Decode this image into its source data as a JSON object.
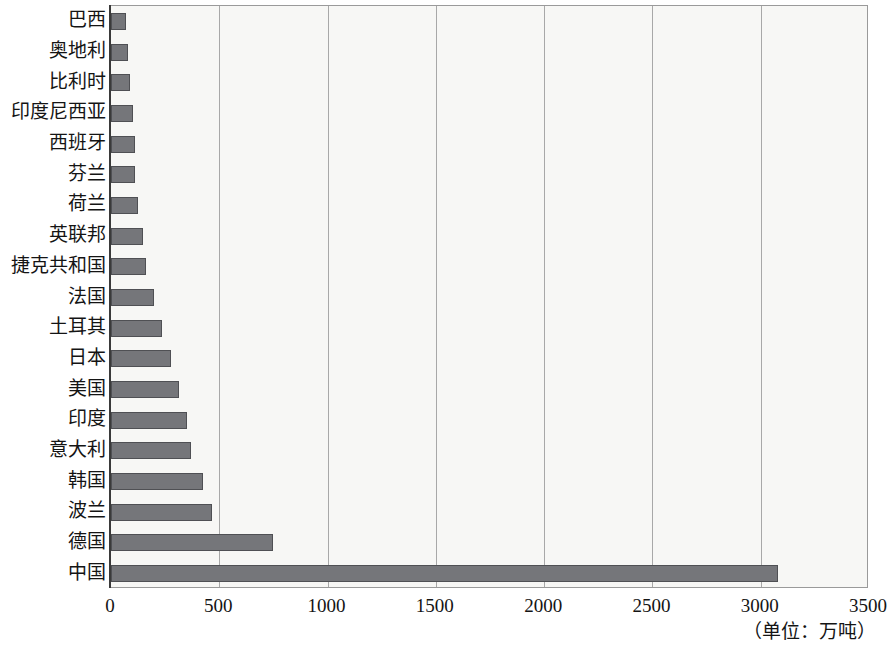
{
  "chart_data": {
    "type": "bar",
    "orientation": "horizontal",
    "title": "",
    "subtitle": "",
    "xlabel": "",
    "ylabel": "",
    "unit_note": "（单位：万吨）",
    "xlim": [
      0,
      3500
    ],
    "xticks": [
      "0",
      "500",
      "1000",
      "1500",
      "2000",
      "2500",
      "3000",
      "3500"
    ],
    "xtick_values": [
      0,
      500,
      1000,
      1500,
      2000,
      2500,
      3000,
      3500
    ],
    "grid": "vertical",
    "legend": "none",
    "bar_color": "#75767a",
    "bar_edge_color": "#4f5054",
    "plot_background": "#f7f7f5",
    "categories": [
      "巴西",
      "奥地利",
      "比利时",
      "印度尼西亚",
      "西班牙",
      "芬兰",
      "荷兰",
      "英联邦",
      "捷克共和国",
      "法国",
      "土耳其",
      "日本",
      "美国",
      "印度",
      "意大利",
      "韩国",
      "波兰",
      "德国",
      "中国"
    ],
    "values": [
      70,
      80,
      90,
      100,
      110,
      110,
      125,
      150,
      160,
      200,
      235,
      275,
      315,
      350,
      370,
      425,
      465,
      750,
      3080
    ]
  }
}
